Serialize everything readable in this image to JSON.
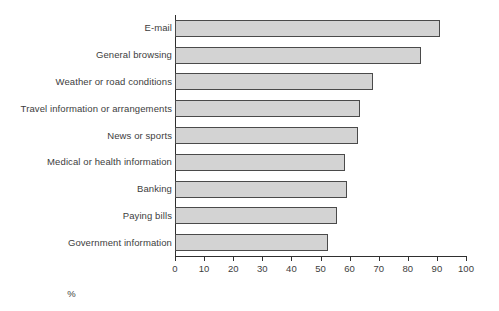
{
  "chart_data": {
    "type": "bar",
    "orientation": "horizontal",
    "title": "",
    "xlabel": "%",
    "ylabel": "",
    "xlim": [
      0,
      100
    ],
    "xticks": [
      0,
      10,
      20,
      30,
      40,
      50,
      60,
      70,
      80,
      90,
      100
    ],
    "grid": false,
    "legend": null,
    "bar_color": "#d3d3d3",
    "bar_border_color": "#4a4a4a",
    "categories": [
      "E-mail",
      "General browsing",
      "Weather or road conditions",
      "Travel information or arrangements",
      "News or sports",
      "Medical or health information",
      "Banking",
      "Paying bills",
      "Government information"
    ],
    "values": [
      91,
      84.5,
      68,
      63.5,
      63,
      58.5,
      59,
      55.5,
      52.5
    ]
  }
}
